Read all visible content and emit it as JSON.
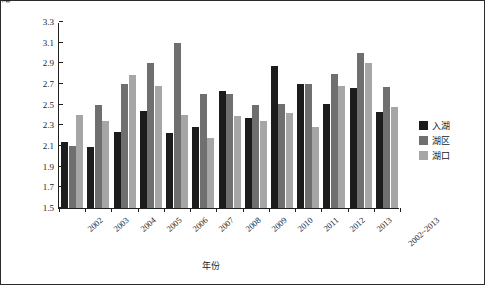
{
  "chart_data": {
    "type": "bar",
    "title": "",
    "xlabel": "年份",
    "ylabel": "高锰酸盐指数浓度(mg/L)",
    "ylim": [
      1.5,
      3.3
    ],
    "ytick_step": 0.2,
    "yticks": [
      "3.3",
      "3.1",
      "2.9",
      "2.7",
      "2.5",
      "2.3",
      "2.1",
      "1.9",
      "1.7",
      "1.5"
    ],
    "grid": false,
    "legend_position": "right",
    "categories": [
      "2002",
      "2003",
      "2004",
      "2005",
      "2006",
      "2007",
      "2008",
      "2009",
      "2010",
      "2011",
      "2012",
      "2013",
      "2002~2013"
    ],
    "series": [
      {
        "name": "入湖",
        "color": "#1c1c1c",
        "values": [
          2.14,
          2.09,
          2.24,
          2.44,
          2.23,
          2.28,
          2.63,
          2.37,
          2.87,
          2.7,
          2.51,
          2.66,
          2.43
        ]
      },
      {
        "name": "湖区",
        "color": "#6f6f6f",
        "values": [
          2.1,
          2.5,
          2.7,
          2.9,
          3.1,
          2.6,
          2.6,
          2.5,
          2.51,
          2.7,
          2.8,
          3.0,
          2.67
        ]
      },
      {
        "name": "湖口",
        "color": "#a6a6a6",
        "values": [
          2.4,
          2.34,
          2.79,
          2.68,
          2.4,
          2.18,
          2.39,
          2.34,
          2.42,
          2.28,
          2.68,
          2.9,
          2.48
        ]
      }
    ]
  }
}
